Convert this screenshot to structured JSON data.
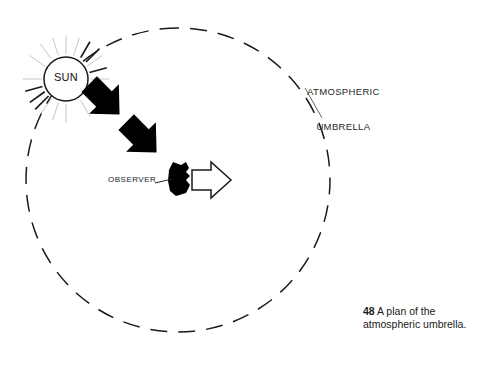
{
  "figure": {
    "caption_number": "48",
    "caption_text": " A plan of the",
    "caption_line2": "atmospheric umbrella."
  },
  "diagram": {
    "sun": {
      "label": "SUN",
      "icon": "sun-icon",
      "center_x": 66,
      "center_y": 79,
      "radius": 22,
      "ray_count": 20,
      "ray_inner": 25,
      "ray_outer": 44
    },
    "umbrella": {
      "label_line1": "ATMOSPHERIC",
      "label_line2": "UMBRELLA",
      "icon": "dashed-circle-icon",
      "center_x": 178,
      "center_y": 180,
      "radius": 152,
      "dash": "17 11"
    },
    "observer": {
      "label": "OBSERVER",
      "icon": "observer-blob-icon"
    },
    "incoming_rays": {
      "icon": "solid-arrow-icon",
      "count": 2,
      "direction": "down-right"
    },
    "outgoing_ray": {
      "icon": "outline-arrow-icon",
      "direction": "right"
    }
  },
  "colors": {
    "stroke": "#1a1a1a",
    "fill_solid": "#000000",
    "fill_outline": "#ffffff",
    "ray_light": "#b9b9b9",
    "background": "#ffffff"
  }
}
